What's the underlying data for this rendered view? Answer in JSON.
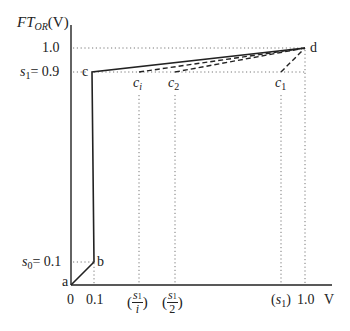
{
  "diagram": {
    "y_axis_label": {
      "main": "FT",
      "sub": "OR",
      "unit": "(V)"
    },
    "x_axis_label": "V",
    "y_ticks": {
      "one": "1.0",
      "s1": {
        "sym": "s",
        "sub": "1",
        "eq": "= 0.9"
      },
      "s0": {
        "sym": "s",
        "sub": "0",
        "eq": "= 0.1"
      }
    },
    "x_ticks": {
      "zero": "0",
      "point_one": "0.1",
      "s1_over_i": {
        "num": "s",
        "num_sub": "1",
        "den": "i"
      },
      "s1_over_2": {
        "num": "s",
        "num_sub": "1",
        "den": "2"
      },
      "s1": {
        "sym": "s",
        "sub": "1"
      },
      "one": "1.0"
    },
    "points": {
      "a": "a",
      "b": "b",
      "c": "c",
      "d": "d",
      "ci": {
        "sym": "c",
        "sub": "i"
      },
      "c2": {
        "sym": "c",
        "sub": "2"
      },
      "c1": {
        "sym": "c",
        "sub": "1"
      }
    },
    "colors": {
      "line": "#222222",
      "dotted": "#666666"
    }
  }
}
